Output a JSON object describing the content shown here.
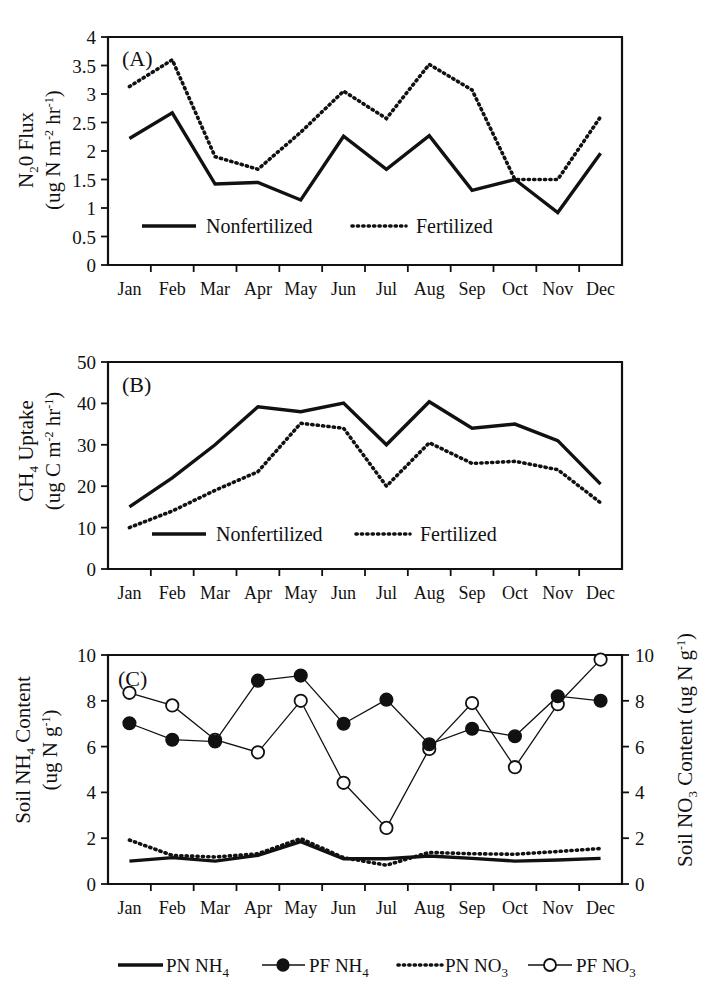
{
  "figure": {
    "months": [
      "Jan",
      "Feb",
      "Mar",
      "Apr",
      "May",
      "Jun",
      "Jul",
      "Aug",
      "Sep",
      "Oct",
      "Nov",
      "Dec"
    ]
  },
  "panel_a": {
    "tag": "(A)",
    "axis_title_line1": "N",
    "axis_title_sub": "2",
    "axis_title_line1b": "0 Flux",
    "axis_title_line2": "(ug N m",
    "axis_title_sup1": "-2",
    "axis_title_line2b": " hr",
    "axis_title_sup2": "-1",
    "axis_title_line2c": ")",
    "y_ticks": [
      "0",
      "0.5",
      "1",
      "1.5",
      "2",
      "2.5",
      "3",
      "3.5",
      "4"
    ],
    "legend": [
      {
        "label": "Nonfertilized",
        "style": "solid"
      },
      {
        "label": "Fertilized",
        "style": "dotted"
      }
    ]
  },
  "panel_b": {
    "tag": "(B)",
    "axis_title_line1": "CH",
    "axis_title_sub": "4",
    "axis_title_line1b": " Uptake",
    "axis_title_line2": "(ug C m",
    "axis_title_sup1": "-2",
    "axis_title_line2b": " hr",
    "axis_title_sup2": "-1",
    "axis_title_line2c": ")",
    "y_ticks": [
      "0",
      "10",
      "20",
      "30",
      "40",
      "50"
    ],
    "legend": [
      {
        "label": "Nonfertilized",
        "style": "solid"
      },
      {
        "label": "Fertilized",
        "style": "dotted"
      }
    ]
  },
  "panel_c": {
    "tag": "(C)",
    "left_axis_title_line1": "Soil NH",
    "left_axis_title_sub": "4",
    "left_axis_title_line1b": " Content",
    "left_axis_title_line2": "(ug N g",
    "left_axis_title_sup": "-1",
    "left_axis_title_line2b": ")",
    "right_axis_title": "Soil NO",
    "right_axis_title_sub": "3",
    "right_axis_title_b": " Content (ug N g",
    "right_axis_title_sup": "-1",
    "right_axis_title_c": ")",
    "y_ticks_left": [
      "0",
      "2",
      "4",
      "6",
      "8",
      "10"
    ],
    "y_ticks_right": [
      "0",
      "2",
      "4",
      "6",
      "8",
      "10"
    ],
    "legend": [
      {
        "label_main": "PN NH",
        "label_sub": "4",
        "style": "solid"
      },
      {
        "label_main": "PF NH",
        "label_sub": "4",
        "style": "solid-filled-marker"
      },
      {
        "label_main": "PN NO",
        "label_sub": "3",
        "style": "dotted"
      },
      {
        "label_main": "PF NO",
        "label_sub": "3",
        "style": "thin-open-marker"
      }
    ]
  },
  "chart_data": [
    {
      "type": "line",
      "panel": "A",
      "title": "N2O Flux",
      "xlabel": "",
      "ylabel": "N2O Flux (ug N m-2 hr-1)",
      "categories": [
        "Jan",
        "Feb",
        "Mar",
        "Apr",
        "May",
        "Jun",
        "Jul",
        "Aug",
        "Sep",
        "Oct",
        "Nov",
        "Dec"
      ],
      "ylim": [
        0,
        4
      ],
      "ytick_step": 0.5,
      "grid": false,
      "legend_position": "inside-bottom",
      "series": [
        {
          "name": "Nonfertilized",
          "style": "solid",
          "values": [
            2.22,
            2.67,
            1.42,
            1.45,
            1.14,
            2.26,
            1.68,
            2.27,
            1.31,
            1.5,
            0.92,
            1.96
          ]
        },
        {
          "name": "Fertilized",
          "style": "dotted",
          "values": [
            3.13,
            3.6,
            1.9,
            1.68,
            2.33,
            3.05,
            2.57,
            3.52,
            3.07,
            1.5,
            1.5,
            2.6
          ]
        }
      ]
    },
    {
      "type": "line",
      "panel": "B",
      "title": "CH4 Uptake",
      "xlabel": "",
      "ylabel": "CH4 Uptake (ug C m-2 hr-1)",
      "categories": [
        "Jan",
        "Feb",
        "Mar",
        "Apr",
        "May",
        "Jun",
        "Jul",
        "Aug",
        "Sep",
        "Oct",
        "Nov",
        "Dec"
      ],
      "ylim": [
        0,
        50
      ],
      "ytick_step": 10,
      "grid": false,
      "legend_position": "inside-bottom",
      "series": [
        {
          "name": "Nonfertilized",
          "style": "solid",
          "values": [
            15.0,
            22.0,
            30.0,
            39.2,
            38.0,
            40.1,
            30.0,
            40.4,
            34.0,
            35.0,
            31.0,
            20.5
          ]
        },
        {
          "name": "Fertilized",
          "style": "dotted",
          "values": [
            10.0,
            14.0,
            19.0,
            23.5,
            35.2,
            34.0,
            20.0,
            30.5,
            25.5,
            26.0,
            24.0,
            16.0
          ]
        }
      ]
    },
    {
      "type": "line",
      "panel": "C",
      "title": "Soil NH4 and NO3 Content",
      "xlabel": "",
      "ylabel": "Soil NH4 Content (ug N g-1)",
      "ylabel_right": "Soil NO3 Content (ug N g-1)",
      "categories": [
        "Jan",
        "Feb",
        "Mar",
        "Apr",
        "May",
        "Jun",
        "Jul",
        "Aug",
        "Sep",
        "Oct",
        "Nov",
        "Dec"
      ],
      "ylim": [
        0,
        10
      ],
      "ylim_right": [
        0,
        10
      ],
      "ytick_step": 2,
      "grid": false,
      "legend_position": "below-axis",
      "series": [
        {
          "name": "PN NH4",
          "style": "solid",
          "axis": "left",
          "values": [
            1.0,
            1.15,
            1.0,
            1.25,
            1.85,
            1.1,
            1.1,
            1.22,
            1.12,
            1.0,
            1.05,
            1.12
          ]
        },
        {
          "name": "PF NH4",
          "style": "solid-filled-marker",
          "axis": "left",
          "values": [
            7.02,
            6.3,
            6.22,
            8.88,
            9.1,
            7.0,
            8.05,
            6.1,
            6.78,
            6.45,
            8.2,
            8.0
          ]
        },
        {
          "name": "PN NO3",
          "style": "dotted",
          "axis": "right",
          "values": [
            1.92,
            1.25,
            1.18,
            1.32,
            1.98,
            1.15,
            0.82,
            1.38,
            1.32,
            1.3,
            1.42,
            1.55
          ]
        },
        {
          "name": "PF NO3",
          "style": "thin-open-marker",
          "axis": "right",
          "values": [
            8.35,
            7.8,
            6.3,
            5.75,
            8.0,
            4.42,
            2.45,
            5.9,
            7.9,
            5.1,
            7.85,
            9.8
          ]
        }
      ]
    }
  ]
}
